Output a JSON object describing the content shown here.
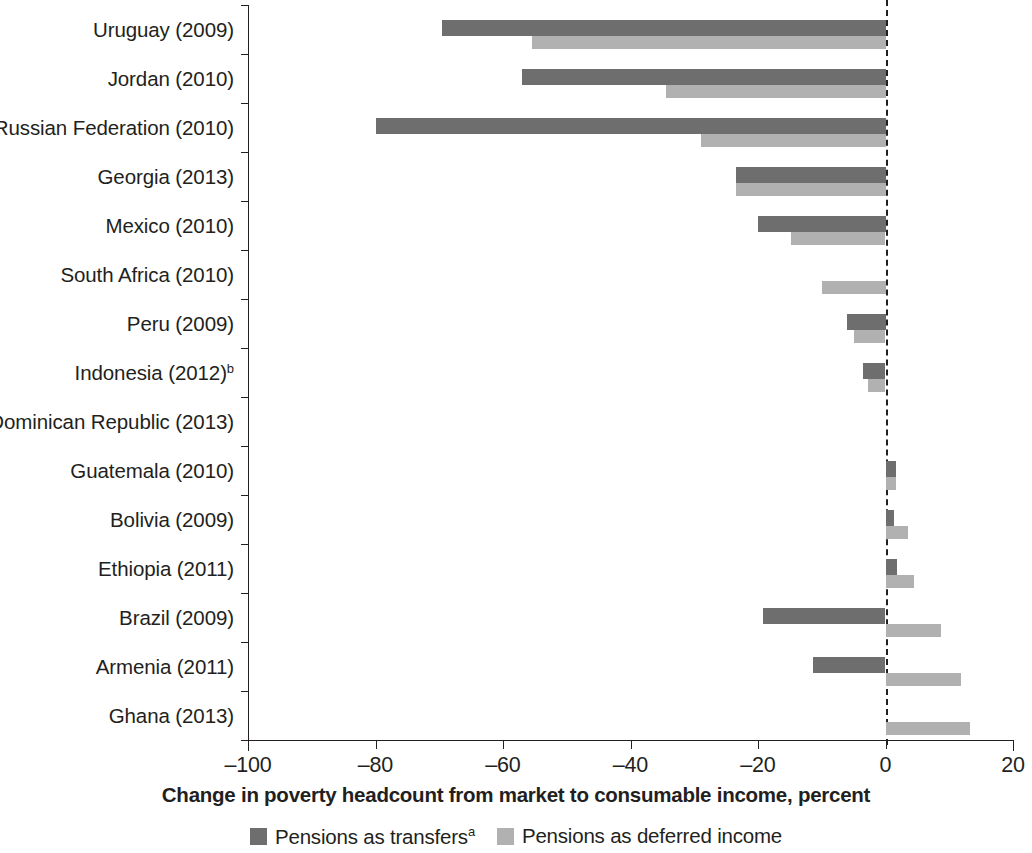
{
  "chart_data": {
    "type": "bar",
    "orientation": "horizontal",
    "title": "",
    "xlabel": "Change in poverty headcount from market to consumable income, percent",
    "ylabel": "",
    "xlim": [
      -100,
      20
    ],
    "xticks": [
      -100,
      -80,
      -60,
      -40,
      -20,
      0,
      20
    ],
    "xtick_labels": [
      "–100",
      "–80",
      "–60",
      "–40",
      "–20",
      "0",
      "20"
    ],
    "grid": false,
    "zero_reference_line": true,
    "legend_position": "bottom",
    "legend": [
      {
        "name": "Pensions as transfers",
        "superscript": "a",
        "color": "#6e6e6e"
      },
      {
        "name": "Pensions as deferred income",
        "superscript": "",
        "color": "#b1b1b1"
      }
    ],
    "categories": [
      "Uruguay (2009)",
      "Jordan (2010)",
      "Russian Federation (2010)",
      "Georgia (2013)",
      "Mexico (2010)",
      "South Africa (2010)",
      "Peru (2009)",
      "Indonesia (2012)",
      "Dominican Republic (2013)",
      "Guatemala (2010)",
      "Bolivia (2009)",
      "Ethiopia (2011)",
      "Brazil (2009)",
      "Armenia (2011)",
      "Ghana (2013)"
    ],
    "category_superscripts": [
      "",
      "",
      "",
      "",
      "",
      "",
      "",
      "b",
      "",
      "",
      "",
      "",
      "",
      "",
      ""
    ],
    "series": [
      {
        "name": "Pensions as transfers",
        "color": "#6e6e6e",
        "values": [
          -69.5,
          -57.0,
          -80.0,
          -23.5,
          -20.0,
          0.0,
          -6.0,
          -3.6,
          0.0,
          1.7,
          1.3,
          1.8,
          -19.2,
          -11.3,
          0.0
        ]
      },
      {
        "name": "Pensions as deferred income",
        "color": "#b1b1b1",
        "values": [
          -55.5,
          -34.5,
          -29.0,
          -23.5,
          -14.8,
          -10.0,
          -4.9,
          -2.8,
          0.0,
          1.6,
          3.6,
          4.4,
          8.7,
          11.8,
          13.3
        ]
      }
    ]
  }
}
